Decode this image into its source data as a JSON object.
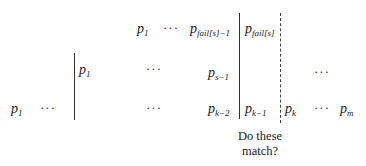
{
  "rows": {
    "top": {
      "p1": {
        "base": "p",
        "sub": "1"
      },
      "dots": "···",
      "p_fail_minus": {
        "base": "p",
        "sub": "fail[s]−1"
      },
      "p_fail": {
        "base": "p",
        "sub": "fail[s]"
      }
    },
    "middle": {
      "p1": {
        "base": "p",
        "sub": "1"
      },
      "dots_left": "···",
      "p_s_minus": {
        "base": "p",
        "sub": "s−1"
      },
      "dots_right": "···"
    },
    "bottom": {
      "p1": {
        "base": "p",
        "sub": "1"
      },
      "dots_left": "···",
      "dots_mid": "···",
      "p_k_minus2": {
        "base": "p",
        "sub": "k−2"
      },
      "p_k_minus1": {
        "base": "p",
        "sub": "k−1"
      },
      "p_k": {
        "base": "p",
        "sub": "k"
      },
      "dots_right": "···",
      "p_m": {
        "base": "p",
        "sub": "m"
      }
    }
  },
  "caption": {
    "line1": "Do these",
    "line2": "match?"
  }
}
